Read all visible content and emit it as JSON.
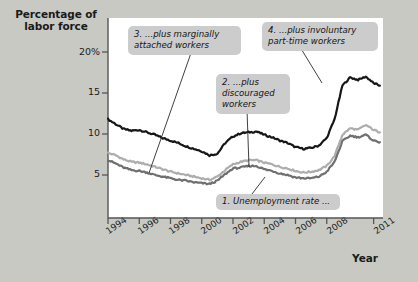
{
  "axes": {
    "y_title": "Percentage of\nlabor force",
    "x_title": "Year",
    "y_ticks": [
      "20%",
      "15",
      "10",
      "5"
    ],
    "x_ticks": [
      "1994",
      "1996",
      "1998",
      "2000",
      "2002",
      "2004",
      "2006",
      "2008",
      "2011"
    ]
  },
  "callouts": {
    "one": "1. Unemployment rate ...",
    "two": "2. ...plus\ndiscouraged\nworkers",
    "three": "3. ...plus marginally\nattached workers",
    "four": "4. ...plus involuntary\npart-time workers"
  },
  "colors": {
    "background": "#c9c9c4",
    "plot_background": "#ffffff",
    "callout_background": "#cccccc",
    "series_u6": "#161616",
    "series_u5": "#adadad",
    "series_u3": "#6f6f6f",
    "axis": "#555555",
    "text": "#1a1a1a"
  },
  "chart_data": {
    "type": "line",
    "title": "",
    "xlabel": "Year",
    "ylabel": "Percentage of labor force",
    "xlim": [
      1994,
      2011.6
    ],
    "ylim": [
      0,
      21.5
    ],
    "ytick_values": [
      20,
      15,
      10,
      5
    ],
    "xtick_values": [
      1994,
      1996,
      1998,
      2000,
      2002,
      2004,
      2006,
      2008,
      2011
    ],
    "grid": false,
    "legend": "annotations-inline",
    "x": [
      1994.0,
      1994.5,
      1995.0,
      1995.5,
      1996.0,
      1996.5,
      1997.0,
      1997.5,
      1998.0,
      1998.5,
      1999.0,
      1999.5,
      2000.0,
      2000.5,
      2001.0,
      2001.5,
      2002.0,
      2002.5,
      2003.0,
      2003.5,
      2004.0,
      2004.5,
      2005.0,
      2005.5,
      2006.0,
      2006.5,
      2007.0,
      2007.5,
      2008.0,
      2008.5,
      2009.0,
      2009.5,
      2010.0,
      2010.5,
      2011.0,
      2011.4
    ],
    "series": [
      {
        "name": "4. ...plus involuntary part-time workers (U-6)",
        "color": "#161616",
        "values": [
          11.8,
          11.2,
          10.6,
          10.4,
          10.5,
          10.2,
          9.9,
          9.5,
          9.2,
          8.9,
          8.5,
          8.2,
          7.9,
          7.4,
          7.6,
          8.9,
          9.7,
          10.1,
          10.2,
          10.3,
          9.9,
          9.6,
          9.2,
          8.9,
          8.4,
          8.2,
          8.3,
          8.6,
          9.5,
          11.8,
          15.9,
          16.9,
          16.6,
          17.0,
          16.2,
          15.9
        ]
      },
      {
        "name": "3. ...plus marginally attached workers (U-5)",
        "color": "#adadad",
        "values": [
          7.7,
          7.4,
          6.9,
          6.6,
          6.5,
          6.3,
          6.0,
          5.7,
          5.4,
          5.2,
          5.0,
          4.8,
          4.6,
          4.4,
          4.8,
          5.6,
          6.3,
          6.6,
          6.8,
          6.8,
          6.5,
          6.3,
          6.0,
          5.8,
          5.5,
          5.3,
          5.4,
          5.6,
          6.1,
          7.3,
          9.9,
          10.7,
          10.5,
          11.1,
          10.5,
          10.2
        ]
      },
      {
        "name": "1. Unemployment rate (U-3)",
        "color": "#6f6f6f",
        "values": [
          6.8,
          6.4,
          5.9,
          5.6,
          5.5,
          5.3,
          5.0,
          4.8,
          4.6,
          4.4,
          4.3,
          4.1,
          4.0,
          3.9,
          4.3,
          5.1,
          5.8,
          5.9,
          6.1,
          6.1,
          5.7,
          5.5,
          5.2,
          5.0,
          4.7,
          4.6,
          4.6,
          4.8,
          5.4,
          6.6,
          9.1,
          9.8,
          9.6,
          9.9,
          9.2,
          9.0
        ]
      }
    ],
    "annotations": [
      {
        "text": "1. Unemployment rate ...",
        "target_x": 2005.2,
        "target_y": 5.9
      },
      {
        "text": "2. ...plus discouraged workers",
        "target_x": 2003.3,
        "target_y": 6.9
      },
      {
        "text": "3. ...plus marginally attached workers",
        "target_x": 1996.3,
        "target_y": 6.4
      },
      {
        "text": "4. ...plus involuntary part-time workers",
        "target_x": 2009.3,
        "target_y": 16.3
      }
    ]
  }
}
